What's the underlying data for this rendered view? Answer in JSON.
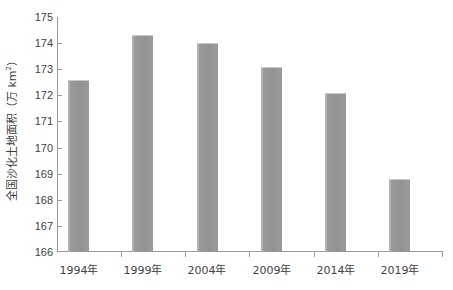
{
  "chart_data": {
    "type": "bar",
    "title": "",
    "xlabel": "",
    "ylabel": "全国沙化土地面积（万 km²）",
    "ylabel_main": "全国沙化土地面积（万 km",
    "ylabel_sup": "2",
    "ylabel_tail": "）",
    "categories": [
      "1994年",
      "1999年",
      "2004年",
      "2009年",
      "2014年",
      "2019年"
    ],
    "values": [
      172.6,
      174.3,
      174.0,
      173.1,
      172.1,
      168.8
    ],
    "ylim": [
      166,
      175
    ],
    "ytick_labels": [
      "175",
      "174",
      "173",
      "172",
      "171",
      "170",
      "169",
      "168",
      "167",
      "166"
    ],
    "ytick_values": [
      175,
      174,
      173,
      172,
      171,
      170,
      169,
      168,
      167,
      166
    ],
    "grid": false,
    "legend": "none",
    "bar_color": "#969696",
    "axis_color": "#9a9a9a",
    "text_color": "#3f3f3f",
    "background": "#ffffff"
  }
}
